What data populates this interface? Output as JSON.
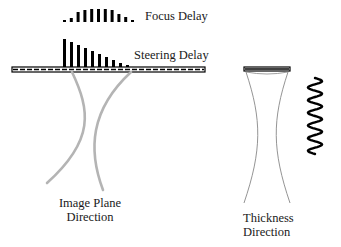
{
  "labels": {
    "focus_delay": "Focus Delay",
    "steering_delay": "Steering Delay",
    "image_plane_line1": "Image Plane",
    "image_plane_line2": "Direction",
    "thickness_line1": "Thickness",
    "thickness_line2": "Direction"
  },
  "focus_delay_bars": [
    2,
    4,
    10,
    12,
    13,
    13,
    13,
    12,
    8,
    5,
    2
  ],
  "steering_delay_bars": [
    28,
    25,
    22,
    19,
    16,
    13,
    10,
    7,
    4,
    2
  ],
  "colors": {
    "ink": "#000000",
    "beam": "#b4b4b4",
    "thin_line": "#888888"
  }
}
